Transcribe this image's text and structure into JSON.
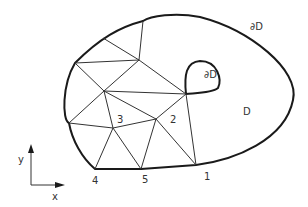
{
  "diagram": {
    "type": "finite-element-mesh",
    "labels": {
      "outer_boundary": "∂D",
      "inner_boundary": "∂D",
      "domain": "D",
      "axis_x": "x",
      "axis_y": "y"
    },
    "nodes": [
      {
        "id": "1",
        "label": "1"
      },
      {
        "id": "2",
        "label": "2"
      },
      {
        "id": "3",
        "label": "3"
      },
      {
        "id": "4",
        "label": "4"
      },
      {
        "id": "5",
        "label": "5"
      }
    ],
    "colors": {
      "stroke": "#1a1a1a",
      "text": "#333333",
      "background": "#ffffff"
    }
  }
}
